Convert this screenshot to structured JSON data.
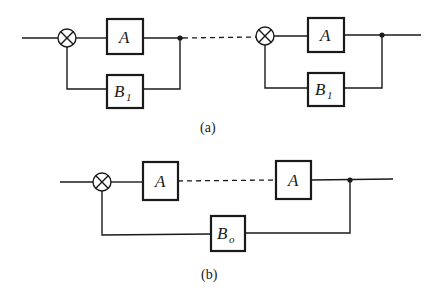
{
  "diagram_a": {
    "caption": "(a)",
    "stages": [
      {
        "forward_block": "A",
        "feedback_block": "B",
        "feedback_subscript": "1"
      },
      {
        "forward_block": "A",
        "feedback_block": "B",
        "feedback_subscript": "1"
      }
    ],
    "connector": "dashed"
  },
  "diagram_b": {
    "caption": "(b)",
    "forward_blocks": [
      "A",
      "A"
    ],
    "feedback_block": "B",
    "feedback_subscript": "o",
    "connector": "dashed"
  },
  "icons": {
    "summing_junction": "circle-with-x",
    "branch_point": "filled-dot"
  },
  "colors": {
    "line": "#1a1a1a",
    "background": "#ffffff"
  }
}
